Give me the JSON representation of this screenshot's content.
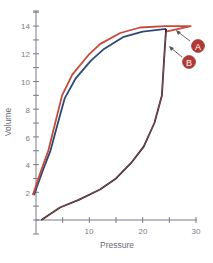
{
  "chart_data": {
    "type": "line",
    "title": "",
    "xlabel": "Pressure",
    "ylabel": "Volume",
    "xlim": [
      0,
      30
    ],
    "ylim": [
      0,
      15
    ],
    "x_ticks": [
      0,
      5,
      10,
      15,
      20,
      25,
      30
    ],
    "x_tick_labels": [
      "10",
      "20",
      "30"
    ],
    "x_tick_label_values": [
      10,
      20,
      30
    ],
    "y_ticks": [
      0,
      1,
      2,
      3,
      4,
      5,
      6,
      7,
      8,
      9,
      10,
      11,
      12,
      13,
      14,
      15
    ],
    "y_tick_labels": [
      "2",
      "4",
      "6",
      "8",
      "10",
      "12",
      "14"
    ],
    "y_tick_label_values": [
      2,
      4,
      6,
      8,
      10,
      12,
      14
    ],
    "grid": false,
    "legend": "none",
    "series": [
      {
        "name": "A",
        "color": "#c8483c",
        "description": "Upper (deflation) limb and inflation limb with plateau overshoot",
        "points": [
          [
            -0.6,
            1.8
          ],
          [
            1.0,
            3.6
          ],
          [
            2.3,
            5.0
          ],
          [
            3.6,
            7.0
          ],
          [
            4.9,
            9.0
          ],
          [
            6.8,
            10.5
          ],
          [
            9.8,
            11.9
          ],
          [
            12.0,
            12.7
          ],
          [
            15.8,
            13.5
          ],
          [
            19.5,
            13.9
          ],
          [
            24.2,
            14.0
          ],
          [
            29.0,
            14.0
          ],
          [
            24.4,
            13.6
          ]
        ],
        "lower_limb": [
          [
            1.0,
            0.0
          ],
          [
            4.5,
            0.9
          ],
          [
            8.0,
            1.45
          ],
          [
            12.0,
            2.2
          ],
          [
            15.0,
            3.0
          ],
          [
            17.8,
            4.1
          ],
          [
            20.2,
            5.3
          ],
          [
            22.2,
            7.0
          ],
          [
            23.6,
            9.0
          ],
          [
            24.0,
            11.5
          ],
          [
            24.4,
            13.6
          ]
        ]
      },
      {
        "name": "B",
        "color": "#2c4a78",
        "description": "Pressure-volume loop without overshoot",
        "points": [
          [
            -0.4,
            1.8
          ],
          [
            1.3,
            3.6
          ],
          [
            2.7,
            5.0
          ],
          [
            4.1,
            7.0
          ],
          [
            5.4,
            8.8
          ],
          [
            7.4,
            10.2
          ],
          [
            10.3,
            11.5
          ],
          [
            12.6,
            12.3
          ],
          [
            16.3,
            13.2
          ],
          [
            20.0,
            13.6
          ],
          [
            24.4,
            13.8
          ]
        ],
        "lower_limb": [
          [
            1.0,
            0.0
          ],
          [
            4.5,
            0.9
          ],
          [
            8.0,
            1.45
          ],
          [
            12.0,
            2.2
          ],
          [
            15.0,
            3.0
          ],
          [
            17.8,
            4.1
          ],
          [
            20.2,
            5.3
          ],
          [
            22.2,
            7.0
          ],
          [
            23.6,
            9.0
          ],
          [
            24.0,
            11.5
          ],
          [
            24.4,
            13.8
          ]
        ]
      }
    ],
    "annotations": [
      {
        "label": "A",
        "target": "red curve plateau",
        "color": "#b23a34"
      },
      {
        "label": "B",
        "target": "blue curve peak",
        "color": "#b23a34"
      }
    ]
  },
  "labels": {
    "xlabel": "Pressure",
    "ylabel": "Volume",
    "marker_a": "A",
    "marker_b": "B",
    "x_tick_10": "10",
    "x_tick_20": "20",
    "x_tick_30": "30",
    "y_tick_2": "2",
    "y_tick_4": "4",
    "y_tick_6": "6",
    "y_tick_8": "8",
    "y_tick_10": "10",
    "y_tick_12": "12",
    "y_tick_14": "14"
  }
}
